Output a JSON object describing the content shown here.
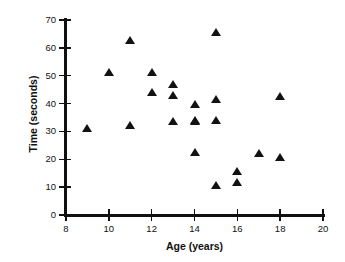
{
  "chart_data": {
    "type": "scatter",
    "title": "",
    "xlabel": "Age (years)",
    "ylabel": "Time (seconds)",
    "xlim": [
      8,
      20
    ],
    "ylim": [
      0,
      70
    ],
    "xticks": [
      8,
      10,
      12,
      14,
      16,
      18,
      20
    ],
    "xtick_labels": [
      "8",
      "10",
      "12",
      "14",
      "16",
      "18",
      "20"
    ],
    "yticks": [
      0,
      10,
      20,
      30,
      40,
      50,
      60,
      70
    ],
    "ytick_labels": [
      "0",
      "10",
      "20",
      "30",
      "40",
      "50",
      "60",
      "70"
    ],
    "grid": false,
    "legend": null,
    "marker": "triangle",
    "marker_color": "#121212",
    "x": [
      9,
      10,
      11,
      11,
      12,
      12,
      13,
      13,
      13,
      14,
      14,
      14,
      14,
      15,
      15,
      15,
      15,
      16,
      16,
      17,
      18,
      18
    ],
    "y": [
      31,
      51,
      62.5,
      32,
      51,
      44,
      47,
      43,
      33.5,
      39.5,
      34,
      33.5,
      22.5,
      65.5,
      41.5,
      34,
      10.5,
      15.5,
      11.5,
      22,
      42.5,
      20.5
    ],
    "points": [
      {
        "x": 9,
        "y": 31
      },
      {
        "x": 10,
        "y": 51
      },
      {
        "x": 11,
        "y": 62.5
      },
      {
        "x": 11,
        "y": 32
      },
      {
        "x": 12,
        "y": 51
      },
      {
        "x": 12,
        "y": 44
      },
      {
        "x": 13,
        "y": 47
      },
      {
        "x": 13,
        "y": 43
      },
      {
        "x": 13,
        "y": 33.5
      },
      {
        "x": 14,
        "y": 39.5
      },
      {
        "x": 14,
        "y": 34
      },
      {
        "x": 14,
        "y": 33.5
      },
      {
        "x": 14,
        "y": 22.5
      },
      {
        "x": 15,
        "y": 65.5
      },
      {
        "x": 15,
        "y": 41.5
      },
      {
        "x": 15,
        "y": 34
      },
      {
        "x": 15,
        "y": 10.5
      },
      {
        "x": 16,
        "y": 15.5
      },
      {
        "x": 16,
        "y": 11.5
      },
      {
        "x": 17,
        "y": 22
      },
      {
        "x": 18,
        "y": 42.5
      },
      {
        "x": 18,
        "y": 20.5
      }
    ]
  }
}
